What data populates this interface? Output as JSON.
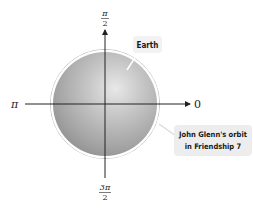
{
  "diagram": {
    "axis_labels": {
      "right": "0",
      "top_numerator": "π",
      "top_denominator": "2",
      "left": "π",
      "bottom_numerator": "3π",
      "bottom_denominator": "2"
    },
    "callouts": {
      "earth": "Earth",
      "orbit_line1": "John Glenn's orbit",
      "orbit_line2": "in Friendship 7"
    },
    "colors": {
      "sphere_light": "#e6e6e6",
      "sphere_mid": "#b4b4b4",
      "sphere_dark": "#8a8a8a",
      "orbit_ring": "#ffffff",
      "axis": "#222222",
      "callout_bg": "#ededed"
    }
  }
}
